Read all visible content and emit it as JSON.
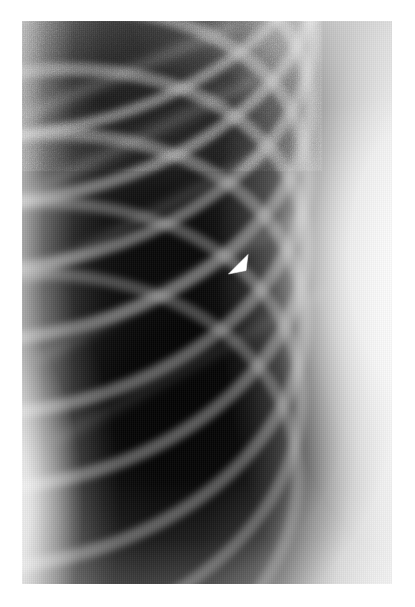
{
  "image": {
    "kind": "medical-radiograph",
    "modality": "chest-x-ray",
    "view": "frontal-lateral-chest-detail",
    "alt_text": "Grayscale chest radiograph detail showing lung field, rib arcs, chest wall soft tissue and a white arrowhead marker",
    "canvas": {
      "width": 415,
      "height": 607,
      "background_hex": "#ffffff"
    },
    "film": {
      "left": 22,
      "top": 21,
      "width": 370,
      "height": 563,
      "border_hex": "#ffffff"
    },
    "tones": {
      "lung_field_dark_hex": "#141414",
      "mid_parenchyma_hex": "#3a3a3a",
      "rib_bone_hex": "#c8c8c8",
      "soft_tissue_bright_hex": "#ededed",
      "chest_wall_hex": "#f2f2f2",
      "marker_hex": "#ffffff"
    },
    "annotations": [
      {
        "name": "arrowhead",
        "shape": "filled-triangle",
        "color_hex": "#ffffff",
        "points_toward": "lower-left",
        "x": 227,
        "y": 253,
        "width": 22,
        "height": 23,
        "label": ""
      }
    ],
    "anatomy_regions": [
      {
        "name": "lung-apex",
        "position": "upper-left"
      },
      {
        "name": "rib-arcs",
        "position": "diagonal-upper-left-to-lower-right"
      },
      {
        "name": "chest-wall-soft-tissue",
        "position": "right-margin"
      },
      {
        "name": "mediastinal-border",
        "position": "lower-left"
      },
      {
        "name": "lower-lung-zone",
        "position": "center-bottom"
      }
    ],
    "ribs": [
      {
        "id": 1,
        "cx": 46,
        "cy": -48,
        "rx": 260,
        "ry": 150,
        "rot": -17,
        "thickness": 11,
        "opacity": 0.5
      },
      {
        "id": 2,
        "cx": 34,
        "cy": 6,
        "rx": 268,
        "ry": 164,
        "rot": -17,
        "thickness": 12,
        "opacity": 0.52
      },
      {
        "id": 3,
        "cx": 24,
        "cy": 62,
        "rx": 274,
        "ry": 176,
        "rot": -17,
        "thickness": 12,
        "opacity": 0.5
      },
      {
        "id": 4,
        "cx": 16,
        "cy": 124,
        "rx": 278,
        "ry": 186,
        "rot": -16,
        "thickness": 13,
        "opacity": 0.48
      },
      {
        "id": 5,
        "cx": 8,
        "cy": 190,
        "rx": 282,
        "ry": 196,
        "rot": -15,
        "thickness": 13,
        "opacity": 0.46
      },
      {
        "id": 6,
        "cx": 2,
        "cy": 258,
        "rx": 286,
        "ry": 204,
        "rot": -14,
        "thickness": 13,
        "opacity": 0.44
      },
      {
        "id": 7,
        "cx": -4,
        "cy": 330,
        "rx": 290,
        "ry": 212,
        "rot": -13,
        "thickness": 13,
        "opacity": 0.42
      },
      {
        "id": 8,
        "cx": -10,
        "cy": 404,
        "rx": 292,
        "ry": 218,
        "rot": -12,
        "thickness": 12,
        "opacity": 0.38
      },
      {
        "id": 9,
        "cx": -16,
        "cy": 478,
        "rx": 294,
        "ry": 222,
        "rot": -11,
        "thickness": 12,
        "opacity": 0.34
      }
    ],
    "posterior_ribs": [
      {
        "id": 101,
        "x1": 0,
        "y1": 96,
        "x2": 210,
        "y2": 6,
        "thickness": 9,
        "opacity": 0.3
      },
      {
        "id": 102,
        "x1": 0,
        "y1": 176,
        "x2": 232,
        "y2": 60,
        "thickness": 9,
        "opacity": 0.28
      },
      {
        "id": 103,
        "x1": 6,
        "y1": 258,
        "x2": 256,
        "y2": 126,
        "thickness": 9,
        "opacity": 0.26
      },
      {
        "id": 104,
        "x1": 18,
        "y1": 338,
        "x2": 278,
        "y2": 196,
        "thickness": 9,
        "opacity": 0.22
      },
      {
        "id": 105,
        "x1": 36,
        "y1": 418,
        "x2": 300,
        "y2": 272,
        "thickness": 9,
        "opacity": 0.18
      }
    ]
  }
}
